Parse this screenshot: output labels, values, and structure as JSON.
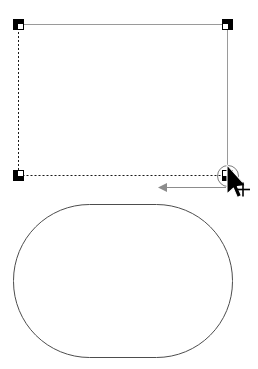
{
  "figure": {
    "title": "Rounded-rectangle corner-radius drag illustration",
    "canvas": {
      "width": 258,
      "height": 369,
      "background": "#ffffff"
    }
  },
  "colors": {
    "handle_fill": "#000000",
    "solid_edge": "#9a9a9a",
    "dashed_edge": "#1a1a1a",
    "direction_arrow": "#8c8c8c",
    "marker_circle": "#7d7d7d",
    "shape_outline": "#4d4d4d",
    "cursor_fill": "#000000",
    "cursor_outline": "#ffffff"
  },
  "selection": {
    "label": "selection-bounding-box",
    "bounds": {
      "x": 18,
      "y": 24,
      "width": 210,
      "height": 152
    },
    "edges": [
      {
        "name": "top-edge",
        "style": "solid",
        "color": "#9a9a9a"
      },
      {
        "name": "right-edge",
        "style": "solid",
        "color": "#9a9a9a"
      },
      {
        "name": "bottom-edge",
        "style": "dashed",
        "color": "#1a1a1a"
      },
      {
        "name": "left-edge",
        "style": "dashed",
        "color": "#1a1a1a"
      }
    ],
    "handles": [
      {
        "name": "handle-top-left",
        "x": 13,
        "y": 19,
        "size": 11,
        "active": false
      },
      {
        "name": "handle-top-right",
        "x": 222,
        "y": 19,
        "size": 11,
        "active": false
      },
      {
        "name": "handle-bottom-left",
        "x": 13,
        "y": 170,
        "size": 11,
        "active": false
      },
      {
        "name": "handle-bottom-right",
        "x": 222,
        "y": 170,
        "size": 11,
        "active": true
      }
    ],
    "active_handle_marker": {
      "name": "active-handle-highlight-circle",
      "cx": 228,
      "cy": 176,
      "r": 10.5,
      "stroke": "#7d7d7d"
    }
  },
  "cursor": {
    "name": "arrow-pointer-cursor",
    "tip_x": 227,
    "tip_y": 165,
    "badge": "+",
    "badge_x": 243,
    "badge_y": 189
  },
  "direction_arrow": {
    "name": "drag-direction-arrow",
    "from_x": 226,
    "to_x": 158,
    "y": 187,
    "head_length": 9,
    "head_half_width": 4,
    "color": "#8c8c8c",
    "points_to": "left"
  },
  "result_shape": {
    "name": "rounded-rectangle-result",
    "x": 13,
    "y": 204,
    "width": 220,
    "height": 154,
    "corner_radius": 76,
    "stroke": "#4d4d4d",
    "stroke_width": 1,
    "fill": "none"
  }
}
